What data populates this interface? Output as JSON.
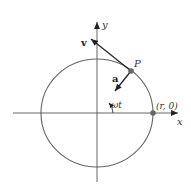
{
  "diagram": {
    "labels": {
      "x_axis": "x",
      "y_axis": "y",
      "point": "P",
      "velocity": "v",
      "acceleration": "a",
      "angle": "ωt",
      "start_point": "(r, 0)"
    },
    "colors": {
      "circle": "#666666",
      "axes": "#555555",
      "vectors": "#222222",
      "points": "#666666",
      "background": "#ffffff"
    }
  }
}
